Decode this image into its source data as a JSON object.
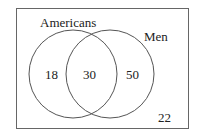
{
  "diagram": {
    "type": "venn",
    "sets": [
      {
        "name": "Americans",
        "only_value": "18"
      },
      {
        "name": "Men",
        "only_value": "50"
      }
    ],
    "intersection_value": "30",
    "outside_value": "22",
    "colors": {
      "stroke": "#555555",
      "text": "#222222",
      "background": "#ffffff"
    }
  }
}
